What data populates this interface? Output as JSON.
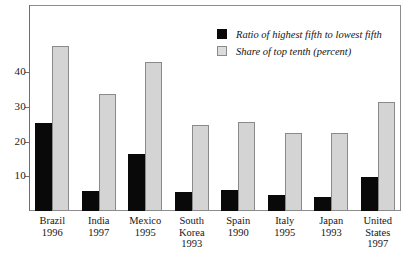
{
  "chart_data": {
    "type": "bar",
    "title": "",
    "xlabel": "",
    "ylabel": "",
    "ylim": [
      0,
      50
    ],
    "grid": false,
    "legend_position": "top-right",
    "categories": [
      "Brazil",
      "India",
      "Mexico",
      "South Korea",
      "Spain",
      "Italy",
      "Japan",
      "United States"
    ],
    "category_years": [
      "1996",
      "1997",
      "1995",
      "1993",
      "1990",
      "1995",
      "1993",
      "1997"
    ],
    "y_ticks": [
      10,
      20,
      30,
      40
    ],
    "series": [
      {
        "name": "Ratio of highest fifth to lowest fifth",
        "color": "#090909",
        "values": [
          25.5,
          5.8,
          16.3,
          5.5,
          6.0,
          4.7,
          4.0,
          9.9
        ]
      },
      {
        "name": "Share of top tenth (percent)",
        "color": "#d4d4d4",
        "values": [
          47.6,
          33.6,
          42.8,
          24.8,
          25.6,
          22.4,
          22.4,
          31.5
        ]
      }
    ]
  },
  "legend": {
    "items": [
      {
        "label": "Ratio of highest fifth to lowest fifth",
        "swatch": "black"
      },
      {
        "label": "Share of top tenth (percent)",
        "swatch": "gray"
      }
    ]
  }
}
